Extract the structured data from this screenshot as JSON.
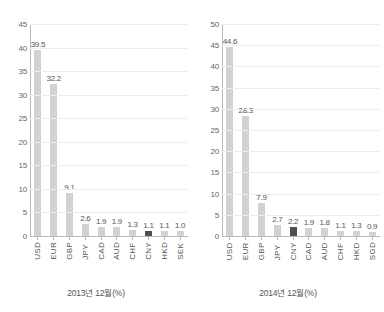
{
  "chart_data": [
    {
      "type": "bar",
      "title": "",
      "caption": "2013년 12월(%)",
      "xlabel": "",
      "ylabel": "",
      "ylim": [
        0,
        45
      ],
      "yticks": [
        0,
        5,
        10,
        15,
        20,
        25,
        30,
        35,
        40,
        45
      ],
      "grid": true,
      "legend": "none",
      "categories": [
        "USD",
        "EUR",
        "GBP",
        "JPY",
        "CAD",
        "AUD",
        "CHF",
        "CNY",
        "HKD",
        "SEK"
      ],
      "values": [
        39.5,
        32.2,
        9.1,
        2.6,
        1.9,
        1.9,
        1.3,
        1.1,
        1.1,
        1.0
      ],
      "labels": [
        "39.5",
        "32.2",
        "9.1",
        "2.6",
        "1.9",
        "1.9",
        "1.3",
        "1.1",
        "1.1",
        "1.0"
      ],
      "highlight_index": 7,
      "bar_color": "#d2d2d2",
      "highlight_color": "#4f4f4f"
    },
    {
      "type": "bar",
      "title": "",
      "caption": "2014년 12월(%)",
      "xlabel": "",
      "ylabel": "",
      "ylim": [
        0,
        50
      ],
      "yticks": [
        0,
        5,
        10,
        15,
        20,
        25,
        30,
        35,
        40,
        45,
        50
      ],
      "grid": true,
      "legend": "none",
      "categories": [
        "USD",
        "EUR",
        "GBP",
        "JPY",
        "CNY",
        "CAD",
        "AUD",
        "CHF",
        "HKD",
        "SGD"
      ],
      "values": [
        44.6,
        28.3,
        7.9,
        2.7,
        2.2,
        1.9,
        1.8,
        1.1,
        1.3,
        0.9
      ],
      "labels": [
        "44.6",
        "28.3",
        "7.9",
        "2.7",
        "2.2",
        "1.9",
        "1.8",
        "1.1",
        "1.3",
        "0.9"
      ],
      "highlight_index": 4,
      "bar_color": "#d2d2d2",
      "highlight_color": "#4f4f4f"
    }
  ]
}
